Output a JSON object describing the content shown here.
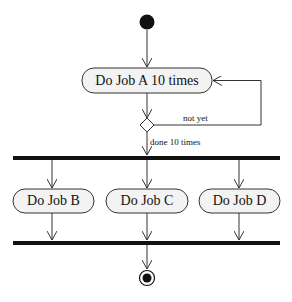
{
  "diagram": {
    "type": "uml-activity",
    "nodes": {
      "start": {
        "kind": "initial"
      },
      "job_a": {
        "label": "Do Job A 10 times"
      },
      "decision": {
        "kind": "decision"
      },
      "fork": {
        "kind": "fork-bar"
      },
      "job_b": {
        "label": "Do Job B"
      },
      "job_c": {
        "label": "Do Job C"
      },
      "job_d": {
        "label": "Do Job D"
      },
      "join": {
        "kind": "join-bar"
      },
      "end": {
        "kind": "final"
      }
    },
    "edges": {
      "loop_guard": "not yet",
      "exit_guard": "done 10 times"
    },
    "colors": {
      "line": "#333333",
      "fill": "#f3f3f3",
      "bar": "#111111"
    }
  }
}
